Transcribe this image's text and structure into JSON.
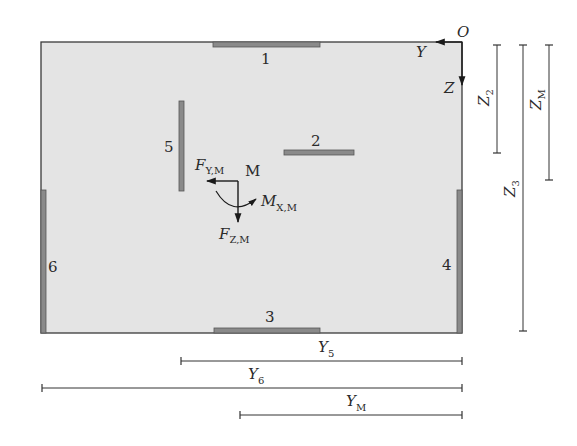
{
  "diagram": {
    "title": "",
    "colors": {
      "panel_fill": "#e4e4e4",
      "panel_stroke": "#3a3a3a",
      "plate_fill": "#8a8a8a",
      "plate_stroke": "#555555",
      "line": "#2a2a2a",
      "text": "#2a2a2a"
    },
    "origin": {
      "label": "O",
      "axis_y_label": "Y",
      "axis_z_label": "Z"
    },
    "plates": [
      {
        "id": "1",
        "label": "1",
        "orientation": "horizontal",
        "position": "top edge"
      },
      {
        "id": "2",
        "label": "2",
        "orientation": "horizontal",
        "position": "interior"
      },
      {
        "id": "3",
        "label": "3",
        "orientation": "horizontal",
        "position": "bottom edge"
      },
      {
        "id": "4",
        "label": "4",
        "orientation": "vertical",
        "position": "right edge"
      },
      {
        "id": "5",
        "label": "5",
        "orientation": "vertical",
        "position": "interior"
      },
      {
        "id": "6",
        "label": "6",
        "orientation": "vertical",
        "position": "left edge"
      }
    ],
    "load_point": {
      "label": "M",
      "force_y": {
        "main": "F",
        "sub": "Y,M"
      },
      "force_z": {
        "main": "F",
        "sub": "Z,M"
      },
      "moment_x": {
        "main": "M",
        "sub": "X,M"
      }
    },
    "dimensions_vertical": [
      {
        "main": "Z",
        "sub": "2"
      },
      {
        "main": "Z",
        "sub": "3"
      },
      {
        "main": "Z",
        "sub": "M"
      }
    ],
    "dimensions_horizontal": [
      {
        "main": "Y",
        "sub": "5"
      },
      {
        "main": "Y",
        "sub": "6"
      },
      {
        "main": "Y",
        "sub": "M"
      }
    ]
  }
}
